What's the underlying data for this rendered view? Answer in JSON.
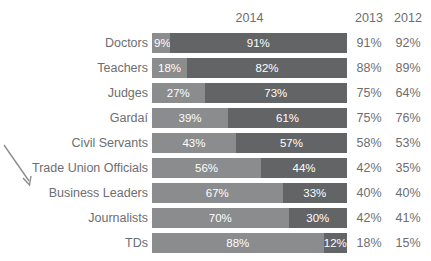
{
  "chart_title": "TRUST IN PROFESSIONS",
  "header": {
    "year_main": "2014",
    "col_2013": "2013",
    "col_2012": "2012"
  },
  "annotation": {
    "arrow_name": "arrow-pointer-icon",
    "points_to": "Business Leaders"
  },
  "chart_data": {
    "type": "bar",
    "orientation": "horizontal",
    "stacked": true,
    "title": "TRUST IN PROFESSIONS",
    "xlabel": "",
    "ylabel": "",
    "xlim": [
      0,
      100
    ],
    "grid": false,
    "legend_position": "none",
    "value_unit": "%",
    "categories": [
      "Doctors",
      "Teachers",
      "Judges",
      "Gardaí",
      "Civil Servants",
      "Trade Union Officials",
      "Business Leaders",
      "Journalists",
      "TDs"
    ],
    "series": [
      {
        "name": "Do not trust 2014",
        "color": "#8a8c8e",
        "values": [
          9,
          18,
          27,
          39,
          43,
          56,
          67,
          70,
          88
        ]
      },
      {
        "name": "Trust 2014",
        "color": "#636466",
        "values": [
          91,
          82,
          73,
          61,
          57,
          44,
          33,
          30,
          12
        ]
      }
    ],
    "extra_columns": [
      {
        "name": "2013",
        "values": [
          91,
          88,
          75,
          75,
          58,
          42,
          40,
          42,
          18
        ]
      },
      {
        "name": "2012",
        "values": [
          92,
          89,
          64,
          76,
          53,
          35,
          40,
          41,
          15
        ]
      }
    ]
  },
  "rows": [
    {
      "label": "Doctors",
      "left_pct": 9,
      "right_pct": 91,
      "left_text": "9%",
      "right_text": "91%",
      "v2013": "91%",
      "v2012": "92%"
    },
    {
      "label": "Teachers",
      "left_pct": 18,
      "right_pct": 82,
      "left_text": "18%",
      "right_text": "82%",
      "v2013": "88%",
      "v2012": "89%"
    },
    {
      "label": "Judges",
      "left_pct": 27,
      "right_pct": 73,
      "left_text": "27%",
      "right_text": "73%",
      "v2013": "75%",
      "v2012": "64%"
    },
    {
      "label": "Gardaí",
      "left_pct": 39,
      "right_pct": 61,
      "left_text": "39%",
      "right_text": "61%",
      "v2013": "75%",
      "v2012": "76%"
    },
    {
      "label": "Civil Servants",
      "left_pct": 43,
      "right_pct": 57,
      "left_text": "43%",
      "right_text": "57%",
      "v2013": "58%",
      "v2012": "53%"
    },
    {
      "label": "Trade Union Officials",
      "left_pct": 56,
      "right_pct": 44,
      "left_text": "56%",
      "right_text": "44%",
      "v2013": "42%",
      "v2012": "35%"
    },
    {
      "label": "Business Leaders",
      "left_pct": 67,
      "right_pct": 33,
      "left_text": "67%",
      "right_text": "33%",
      "v2013": "40%",
      "v2012": "40%"
    },
    {
      "label": "Journalists",
      "left_pct": 70,
      "right_pct": 30,
      "left_text": "70%",
      "right_text": "30%",
      "v2013": "42%",
      "v2012": "41%"
    },
    {
      "label": "TDs",
      "left_pct": 88,
      "right_pct": 12,
      "left_text": "88%",
      "right_text": "12%",
      "v2013": "18%",
      "v2012": "15%"
    }
  ]
}
